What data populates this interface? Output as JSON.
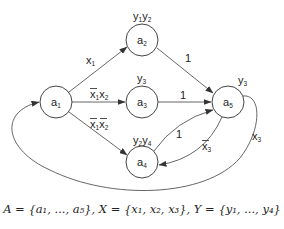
{
  "diagram": {
    "type": "state-machine",
    "nodes": [
      {
        "id": "a1",
        "label": "a",
        "sub": "1",
        "output": "",
        "x": 56,
        "y": 102
      },
      {
        "id": "a2",
        "label": "a",
        "sub": "2",
        "output": "y1y2",
        "x": 142,
        "y": 40
      },
      {
        "id": "a3",
        "label": "a",
        "sub": "3",
        "output": "y3",
        "x": 142,
        "y": 102
      },
      {
        "id": "a4",
        "label": "a",
        "sub": "4",
        "output": "y2y4",
        "x": 142,
        "y": 162
      },
      {
        "id": "a5",
        "label": "a",
        "sub": "5",
        "output": "y3",
        "x": 228,
        "y": 102
      }
    ],
    "edges": [
      {
        "from": "a1",
        "to": "a2",
        "label": "x1"
      },
      {
        "from": "a1",
        "to": "a3",
        "label": "¬x1 x2"
      },
      {
        "from": "a1",
        "to": "a4",
        "label": "¬x1 ¬x2"
      },
      {
        "from": "a2",
        "to": "a5",
        "label": "1"
      },
      {
        "from": "a3",
        "to": "a5",
        "label": "1"
      },
      {
        "from": "a4",
        "to": "a5",
        "label": "1"
      },
      {
        "from": "a5",
        "to": "a4",
        "label": "¬x3"
      },
      {
        "from": "a5",
        "to": "a1",
        "label": "x3"
      }
    ],
    "labels": {
      "a2_out": [
        "y",
        "1",
        "y",
        "2"
      ],
      "a3_out": [
        "y",
        "3"
      ],
      "a4_out": [
        "y",
        "2",
        "y",
        "4"
      ],
      "a5_out": [
        "y",
        "3"
      ],
      "e12": [
        "x",
        "1"
      ],
      "e13": [
        "x",
        "1",
        "x",
        "2"
      ],
      "e14": [
        "x",
        "1",
        "x",
        "2"
      ],
      "e25": "1",
      "e35": "1",
      "e45": "1",
      "e54": [
        "x",
        "3"
      ],
      "e51": [
        "x",
        "3"
      ]
    }
  },
  "caption": "A = {a₁, ..., a₅}, X = {x₁, x₂, x₃}, Y = {y₁, ..., y₄}"
}
